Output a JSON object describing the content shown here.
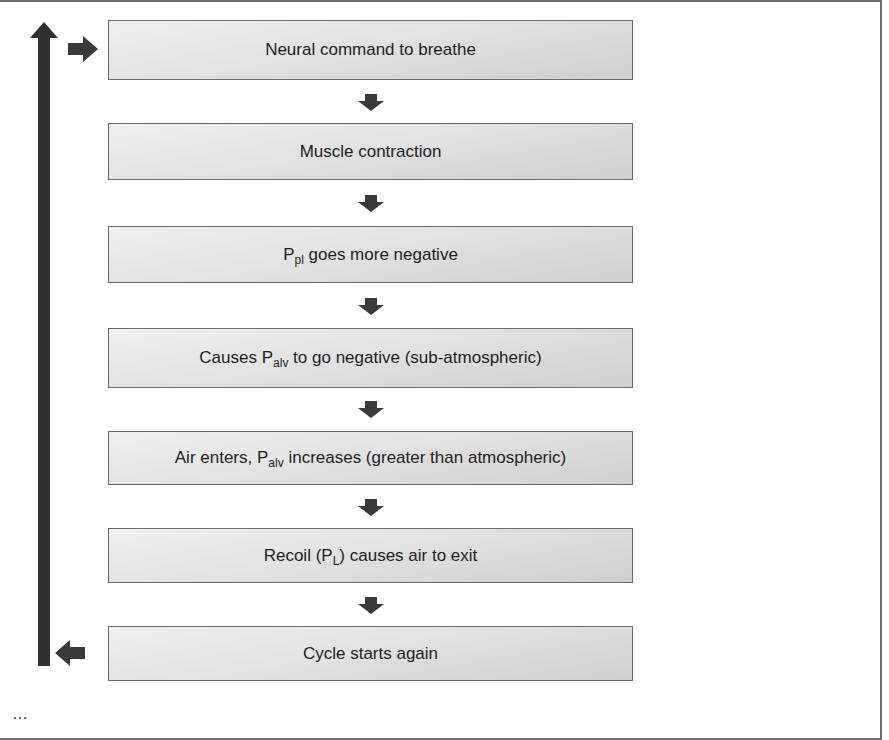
{
  "diagram": {
    "type": "flowchart-cycle",
    "colors": {
      "arrow": "#3a3a3a",
      "box_border": "#6a6a6a",
      "box_fill_light": "#f1f1f1",
      "box_fill_dark": "#cfcfcf",
      "frame_border": "#6e6e6e"
    },
    "steps": [
      {
        "pre": "Neural command to breathe",
        "sub": "",
        "post": ""
      },
      {
        "pre": "Muscle contraction",
        "sub": "",
        "post": ""
      },
      {
        "pre": "P",
        "sub": "pl",
        "post": " goes more negative"
      },
      {
        "pre": "Causes P",
        "sub": "alv",
        "post": " to go negative (sub-atmospheric)"
      },
      {
        "pre": "Air enters, P",
        "sub": "alv",
        "post": " increases (greater than atmospheric)"
      },
      {
        "pre": "Recoil (P",
        "sub": "L",
        "post": ") causes air to exit"
      },
      {
        "pre": "Cycle starts again",
        "sub": "",
        "post": ""
      }
    ],
    "connectors": [
      "down",
      "down",
      "down",
      "down",
      "down",
      "down"
    ],
    "loop": {
      "direction": "bottom-to-top",
      "from_step": 7,
      "to_step": 1
    },
    "caption_clipped": "…"
  }
}
